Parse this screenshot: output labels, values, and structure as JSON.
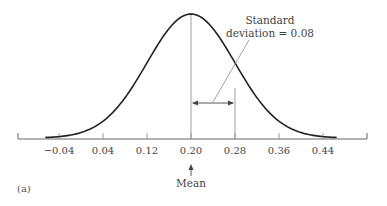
{
  "chart_data": {
    "type": "line",
    "title": "",
    "xlabel": "",
    "ylabel": "",
    "distribution": {
      "mean": 0.2,
      "std": 0.08
    },
    "xlim": [
      -0.08,
      0.48
    ],
    "ticks": [
      "-0.04",
      "0.04",
      "0.12",
      "0.20",
      "0.28",
      "0.36",
      "0.44"
    ],
    "tick_values": [
      -0.04,
      0.04,
      0.12,
      0.2,
      0.28,
      0.36,
      0.44
    ],
    "grid": false,
    "legend": null,
    "annotations": [
      {
        "text_line1": "Standard",
        "text_line2": "deviation = 0.08",
        "target": "arrow from mean (0.20) to 0.28"
      },
      {
        "text": "Mean",
        "target": "arrow pointing up at 0.20"
      }
    ],
    "panel_label": "(a)"
  }
}
